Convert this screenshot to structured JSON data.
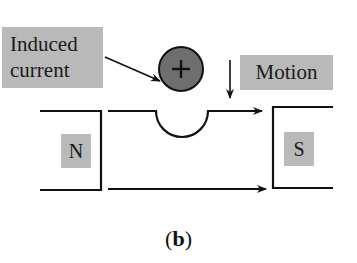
{
  "diagram": {
    "labels": {
      "induced_current_line1": "Induced",
      "induced_current_line2": "current",
      "motion": "Motion",
      "north_pole": "N",
      "south_pole": "S",
      "charge_symbol": "+"
    },
    "caption": {
      "open": "(",
      "letter": "b",
      "close": ")"
    },
    "colors": {
      "label_background": "#b9b9b9",
      "conductor_fill": "#6e6e6e",
      "line": "#111111"
    }
  }
}
